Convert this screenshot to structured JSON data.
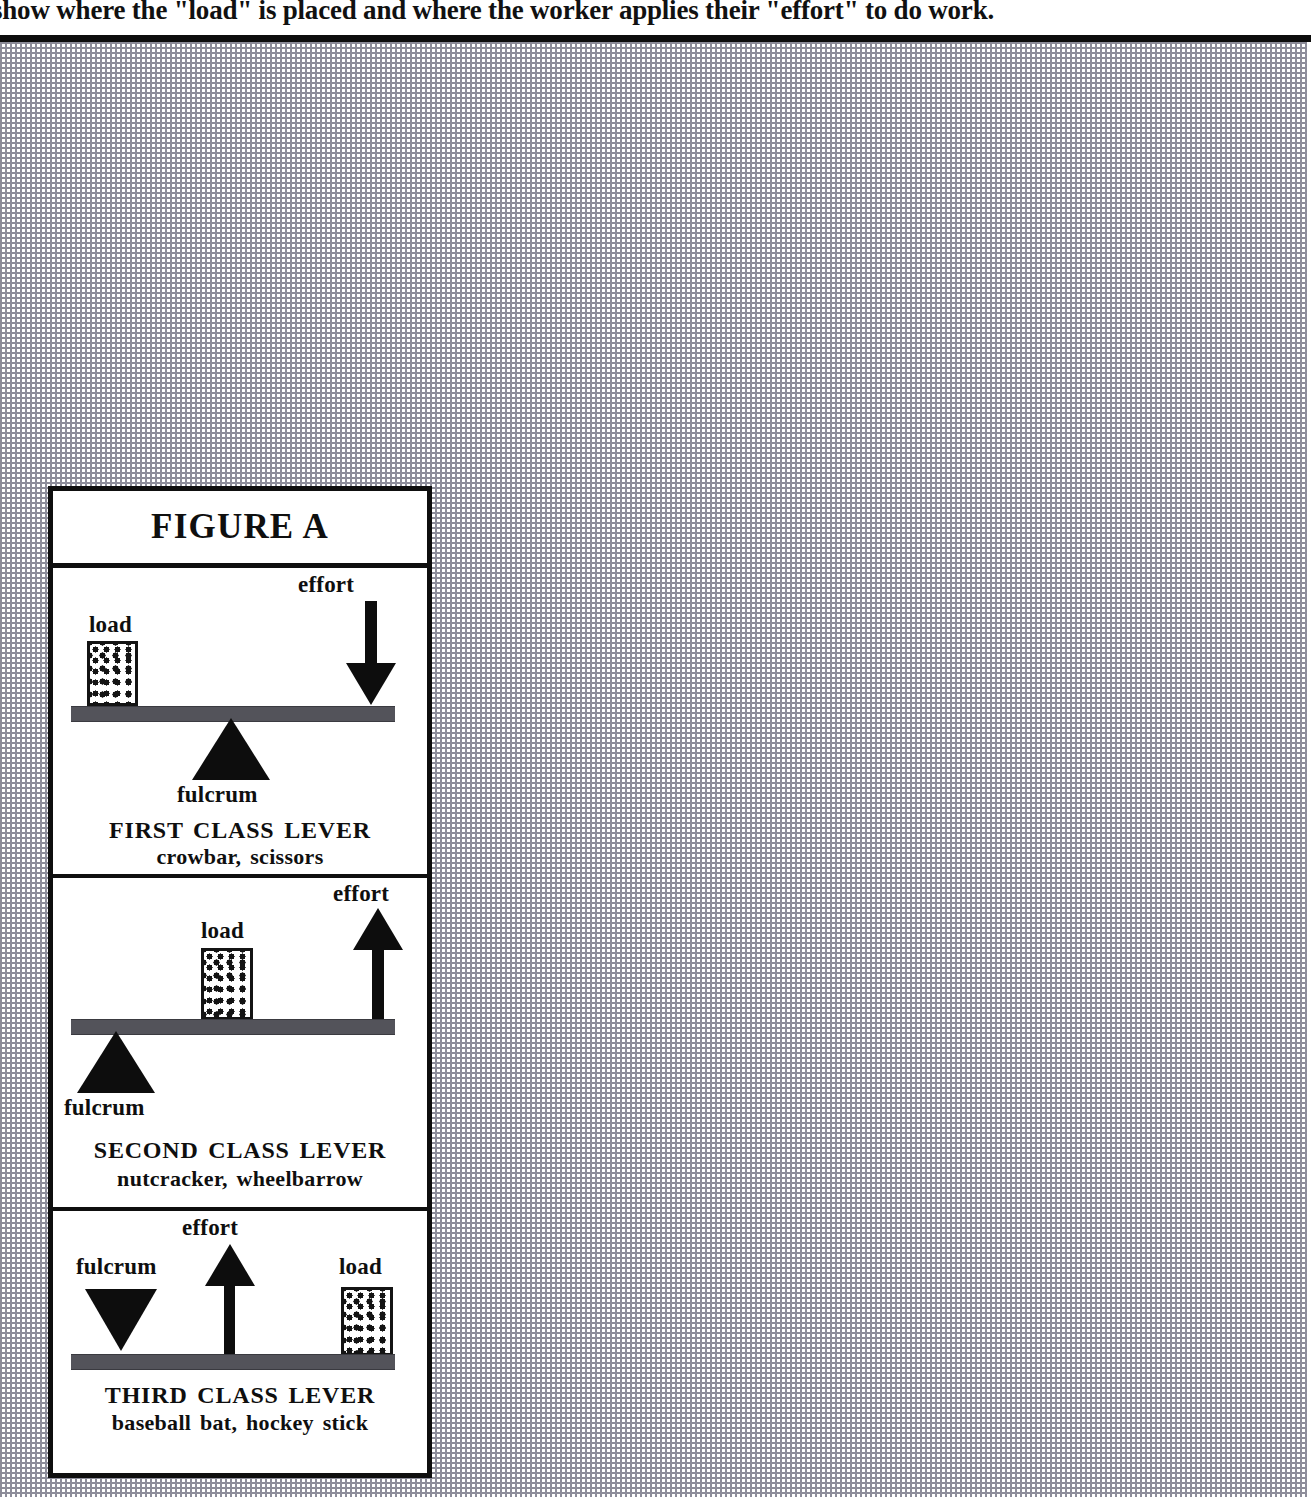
{
  "header": {
    "text": "show where the \"load\" is placed and where the worker applies their \"effort\" to do work."
  },
  "figure": {
    "title": "FIGURE A",
    "panels": [
      {
        "id": "first-class-lever",
        "caption_main": "FIRST CLASS LEVER",
        "caption_sub": "crowbar, scissors",
        "labels": {
          "load": "load",
          "effort": "effort",
          "fulcrum": "fulcrum"
        },
        "arrangement": "load-left, fulcrum-center-under-beam, effort-right-pointing-down"
      },
      {
        "id": "second-class-lever",
        "caption_main": "SECOND CLASS LEVER",
        "caption_sub": "nutcracker, wheelbarrow",
        "labels": {
          "load": "load",
          "effort": "effort",
          "fulcrum": "fulcrum"
        },
        "arrangement": "fulcrum-left-under-beam, load-center-on-beam, effort-right-pointing-up"
      },
      {
        "id": "third-class-lever",
        "caption_main": "THIRD CLASS LEVER",
        "caption_sub": "baseball bat, hockey stick",
        "labels": {
          "load": "load",
          "effort": "effort",
          "fulcrum": "fulcrum"
        },
        "arrangement": "fulcrum-left-above-beam, effort-center-pointing-up, load-right-on-beam"
      }
    ]
  },
  "colors": {
    "ink": "#0f0f0f",
    "beam": "#53535a",
    "grid": "#8a8a96",
    "paper": "#ffffff"
  }
}
